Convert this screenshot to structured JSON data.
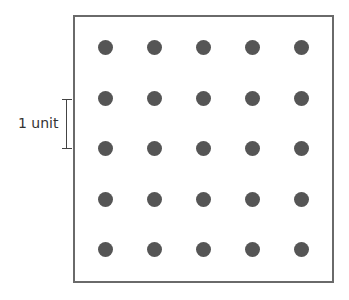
{
  "diagram": {
    "title": "",
    "grid": {
      "rows": 5,
      "cols": 5,
      "dot_color": "#555555",
      "frame_color": "#6a6a6a",
      "x_positions": [
        105,
        154,
        203,
        252,
        301
      ],
      "y_positions": [
        47,
        98,
        148,
        199,
        249
      ]
    },
    "scale": {
      "label": "1 unit",
      "spans": "distance between adjacent rows"
    }
  }
}
